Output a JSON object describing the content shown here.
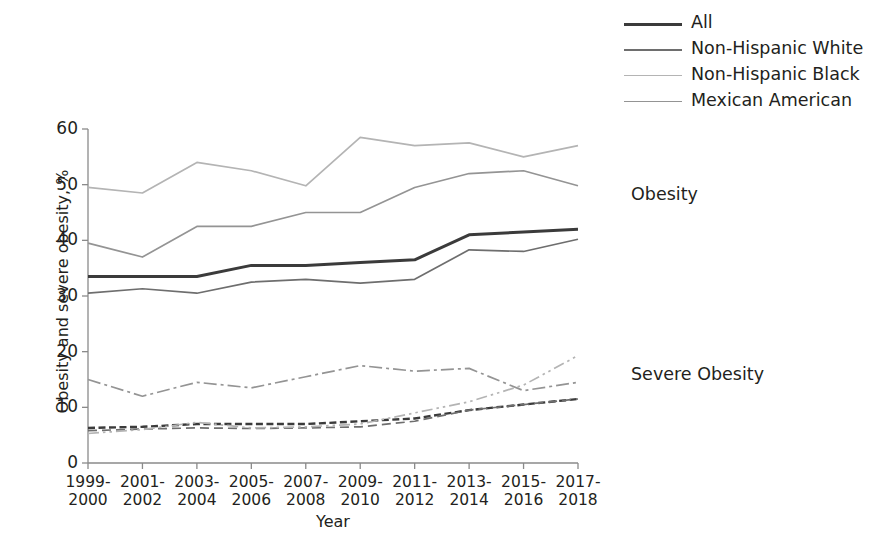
{
  "chart_data": {
    "type": "line",
    "title": "",
    "xlabel": "Year",
    "ylabel": "Obesity and severe obesity, %",
    "ylim": [
      0,
      60
    ],
    "yticks": [
      0,
      10,
      20,
      30,
      40,
      50,
      60
    ],
    "grid": false,
    "categories": [
      "1999-\n2000",
      "2001-\n2002",
      "2003-\n2004",
      "2005-\n2006",
      "2007-\n2008",
      "2009-\n2010",
      "2011-\n2012",
      "2013-\n2014",
      "2015-\n2016",
      "2017-\n2018"
    ],
    "category_lines": [
      [
        "1999-",
        "2000"
      ],
      [
        "2001-",
        "2002"
      ],
      [
        "2003-",
        "2004"
      ],
      [
        "2005-",
        "2006"
      ],
      [
        "2007-",
        "2008"
      ],
      [
        "2009-",
        "2010"
      ],
      [
        "2011-",
        "2012"
      ],
      [
        "2013-",
        "2014"
      ],
      [
        "2015-",
        "2016"
      ],
      [
        "2017-",
        "2018"
      ]
    ],
    "groups": [
      {
        "name": "Obesity",
        "style": "solid",
        "annotation": "Obesity"
      },
      {
        "name": "Severe Obesity",
        "style": "dashed",
        "annotation": "Severe Obesity"
      }
    ],
    "series": [
      {
        "name": "All",
        "group": "Obesity",
        "style": "solid",
        "color": "#3b3b3b",
        "width": 3.0,
        "values": [
          33.5,
          33.5,
          33.5,
          35.5,
          35.5,
          36.0,
          36.5,
          41.0,
          41.5,
          42.0
        ]
      },
      {
        "name": "Non-Hispanic White",
        "group": "Obesity",
        "style": "solid",
        "color": "#6e6e6e",
        "width": 1.7,
        "values": [
          30.5,
          31.3,
          30.5,
          32.5,
          33.0,
          32.3,
          33.0,
          38.3,
          38.0,
          40.2
        ]
      },
      {
        "name": "Non-Hispanic Black",
        "group": "Obesity",
        "style": "solid",
        "color": "#b4b4b4",
        "width": 1.7,
        "values": [
          49.5,
          48.5,
          54.0,
          52.5,
          49.8,
          58.5,
          57.0,
          57.5,
          55.0,
          57.0
        ]
      },
      {
        "name": "Mexican American",
        "group": "Obesity",
        "style": "solid",
        "color": "#949494",
        "width": 1.7,
        "values": [
          39.5,
          37.0,
          42.5,
          42.5,
          45.0,
          45.0,
          49.5,
          52.0,
          52.5,
          49.8
        ]
      },
      {
        "name": "All",
        "group": "Severe Obesity",
        "style": "dotted-dense",
        "color": "#3b3b3b",
        "width": 2.4,
        "values": [
          6.3,
          6.5,
          7.0,
          7.0,
          7.0,
          7.5,
          8.0,
          9.5,
          10.5,
          11.5
        ]
      },
      {
        "name": "Non-Hispanic White",
        "group": "Severe Obesity",
        "style": "dashed",
        "color": "#6e6e6e",
        "width": 1.7,
        "values": [
          5.8,
          6.1,
          6.3,
          6.2,
          6.3,
          6.5,
          7.5,
          9.5,
          10.5,
          11.5
        ]
      },
      {
        "name": "Non-Hispanic Black",
        "group": "Severe Obesity",
        "style": "dash-dot-dot",
        "color": "#b4b4b4",
        "width": 1.7,
        "values": [
          5.3,
          6.0,
          7.3,
          6.3,
          6.5,
          7.0,
          9.0,
          11.0,
          14.0,
          19.3
        ]
      },
      {
        "name": "Mexican American",
        "group": "Severe Obesity",
        "style": "dash-dot",
        "color": "#949494",
        "width": 1.7,
        "values": [
          15.0,
          12.0,
          14.5,
          13.5,
          15.5,
          17.5,
          16.5,
          17.0,
          13.0,
          14.5
        ]
      }
    ]
  },
  "legend": {
    "position": "top-right",
    "items": [
      {
        "label": "All",
        "color": "#3b3b3b",
        "width": 3.2
      },
      {
        "label": "Non-Hispanic White",
        "color": "#6e6e6e",
        "width": 2.0
      },
      {
        "label": "Non-Hispanic Black",
        "color": "#b4b4b4",
        "width": 1.7
      },
      {
        "label": "Mexican American",
        "color": "#949494",
        "width": 1.9
      }
    ]
  },
  "annotations": {
    "obesity": "Obesity",
    "severe_obesity": "Severe Obesity"
  },
  "axes": {
    "x_title": "Year",
    "y_title": "Obesity and severe obesity, %",
    "y_tick_labels": [
      "60",
      "50",
      "40",
      "30",
      "20",
      "10",
      "0"
    ]
  },
  "colors": {
    "all": "#3b3b3b",
    "non_hispanic_white": "#6e6e6e",
    "non_hispanic_black": "#b4b4b4",
    "mexican_american": "#949494",
    "axis": "#8a8a8a",
    "text": "#231f20",
    "background": "#ffffff"
  }
}
